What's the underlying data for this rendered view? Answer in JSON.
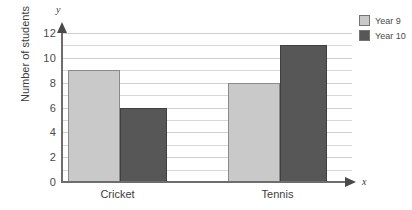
{
  "chart_data": {
    "type": "bar",
    "title": "",
    "xlabel": "x",
    "ylabel": "Number of students",
    "categories": [
      "Cricket",
      "Tennis"
    ],
    "series": [
      {
        "name": "Year 9",
        "values": [
          9,
          8
        ],
        "color": "#c9c9c9"
      },
      {
        "name": "Year 10",
        "values": [
          6,
          11
        ],
        "color": "#575757"
      }
    ],
    "ylim": [
      0,
      12
    ],
    "ytick_step": 2,
    "yticks": [
      0,
      2,
      4,
      6,
      8,
      10,
      12
    ],
    "ytick_labels": [
      "0",
      "2",
      "4",
      "6",
      "8",
      "10",
      "12"
    ],
    "grid": true,
    "gridline_step": 1,
    "legend_position": "top-right",
    "axis_letters": {
      "y": "y",
      "x": "x"
    }
  },
  "axis": {
    "y_title": "Number of students",
    "y_letter": "y",
    "x_letter": "x"
  },
  "legend": {
    "items": [
      {
        "label": "Year 9"
      },
      {
        "label": "Year 10"
      }
    ]
  }
}
